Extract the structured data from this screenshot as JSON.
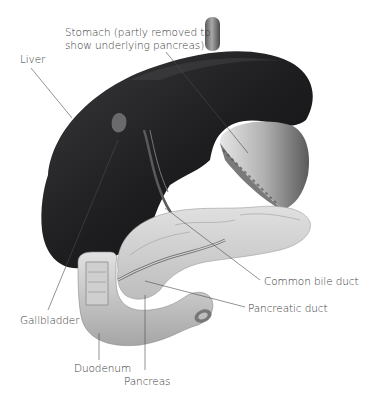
{
  "diagram": {
    "labels": {
      "stomach_line1": "Stomach (partly removed to",
      "stomach_line2": "show underlying pancreas)",
      "liver": "Liver",
      "common_bile_duct": "Common bile duct",
      "pancreatic_duct": "Pancreatic duct",
      "gallbladder": "Gallbladder",
      "duodenum": "Duodenum",
      "pancreas": "Pancreas"
    },
    "colors": {
      "liver": "#1c1c1e",
      "stomach": "#b8b8b8",
      "pancreas": "#d4d4d4",
      "duodenum": "#c6c6c6",
      "leader_line": "#4a4a4a",
      "text": "#3a3a3a",
      "background": "#ffffff"
    }
  }
}
